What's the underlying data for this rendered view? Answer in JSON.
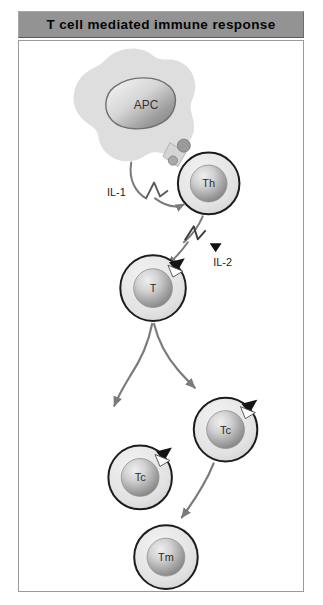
{
  "figure": {
    "title": "T cell mediated immune response",
    "background_color": "#ffffff",
    "header_color": "#939393",
    "frame_border_color": "#9a9a9a",
    "arrow_color": "#7b7b7b"
  },
  "cells": [
    {
      "id": "apc",
      "label": "APC",
      "type": "antigen-presenting-cell",
      "shape": "amoeboid",
      "has_receptor": false
    },
    {
      "id": "th",
      "label": "Th",
      "type": "helper-t-cell",
      "shape": "round",
      "has_receptor": false
    },
    {
      "id": "t",
      "label": "T",
      "type": "t-cell",
      "shape": "round",
      "has_receptor": true
    },
    {
      "id": "tc-right",
      "label": "Tc",
      "type": "cytotoxic-t-cell",
      "shape": "round",
      "has_receptor": true
    },
    {
      "id": "tc-left",
      "label": "Tc",
      "type": "cytotoxic-t-cell",
      "shape": "round",
      "has_receptor": true
    },
    {
      "id": "tm",
      "label": "Tm",
      "type": "memory-t-cell",
      "shape": "round",
      "has_receptor": false
    }
  ],
  "signals": [
    {
      "id": "il1",
      "label": "IL-1",
      "from": "apc",
      "to": "th"
    },
    {
      "id": "il2",
      "label": "IL-2",
      "from": "th",
      "to": "t"
    }
  ]
}
